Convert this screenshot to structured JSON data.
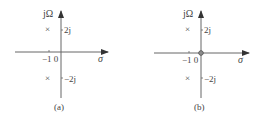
{
  "diagrams": [
    {
      "id": "a",
      "caption": "(a)",
      "y_axis_label": "jΩ",
      "x_axis_label": "σ",
      "tick_pos_label": "2j",
      "tick_neg_label": "−2j",
      "origin_label": "−1 0",
      "poles": [
        "×",
        "×"
      ],
      "zeros": []
    },
    {
      "id": "b",
      "caption": "(b)",
      "y_axis_label": "jΩ",
      "x_axis_label": "σ",
      "tick_pos_label": "2j",
      "tick_neg_label": "−2j",
      "origin_label": "−1 0",
      "poles": [
        "×",
        "×"
      ],
      "zeros": [
        "o"
      ]
    }
  ],
  "colors": {
    "axis": "#555555",
    "text": "#444444"
  }
}
